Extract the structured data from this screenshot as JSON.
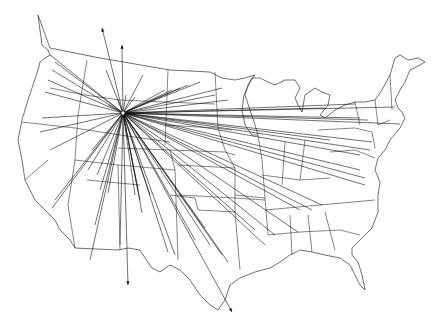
{
  "map": {
    "subject": "Contiguous United States outline map with state borders",
    "hub": {
      "x": 123,
      "y": 113,
      "marker": "circle"
    },
    "line_color": "#111111",
    "background": "#ffffff",
    "arrows": [
      {
        "to_x": 102,
        "to_y": 28,
        "arrowhead": true
      },
      {
        "to_x": 122,
        "to_y": 45,
        "arrowhead": true
      },
      {
        "to_x": 128,
        "to_y": 285,
        "arrowhead": true
      },
      {
        "to_x": 232,
        "to_y": 312,
        "arrowhead": true
      }
    ],
    "ray_endpoints": [
      [
        50,
        55
      ],
      [
        55,
        62
      ],
      [
        52,
        70
      ],
      [
        48,
        80
      ],
      [
        45,
        92
      ],
      [
        42,
        118
      ],
      [
        40,
        132
      ],
      [
        50,
        150
      ],
      [
        55,
        200
      ],
      [
        52,
        208
      ],
      [
        88,
        170
      ],
      [
        92,
        150
      ],
      [
        97,
        175
      ],
      [
        100,
        190
      ],
      [
        108,
        193
      ],
      [
        95,
        225
      ],
      [
        90,
        260
      ],
      [
        120,
        245
      ],
      [
        135,
        195
      ],
      [
        138,
        190
      ],
      [
        140,
        200
      ],
      [
        106,
        70
      ],
      [
        108,
        105
      ],
      [
        118,
        100
      ],
      [
        126,
        95
      ],
      [
        135,
        97
      ],
      [
        143,
        75
      ],
      [
        165,
        90
      ],
      [
        172,
        90
      ],
      [
        180,
        88
      ],
      [
        188,
        85
      ],
      [
        200,
        82
      ],
      [
        215,
        95
      ],
      [
        222,
        88
      ],
      [
        228,
        100
      ],
      [
        325,
        108
      ],
      [
        355,
        104
      ],
      [
        395,
        107
      ],
      [
        360,
        118
      ],
      [
        368,
        120
      ],
      [
        400,
        124
      ],
      [
        330,
        140
      ],
      [
        372,
        142
      ],
      [
        370,
        150
      ],
      [
        360,
        155
      ],
      [
        360,
        170
      ],
      [
        365,
        185
      ],
      [
        365,
        178
      ],
      [
        322,
        205
      ],
      [
        312,
        210
      ],
      [
        300,
        210
      ],
      [
        298,
        232
      ],
      [
        275,
        235
      ],
      [
        265,
        245
      ],
      [
        255,
        230
      ],
      [
        228,
        262
      ],
      [
        222,
        255
      ],
      [
        210,
        245
      ],
      [
        205,
        228
      ],
      [
        195,
        240
      ],
      [
        175,
        255
      ],
      [
        168,
        252
      ],
      [
        150,
        195
      ],
      [
        142,
        213
      ]
    ]
  }
}
